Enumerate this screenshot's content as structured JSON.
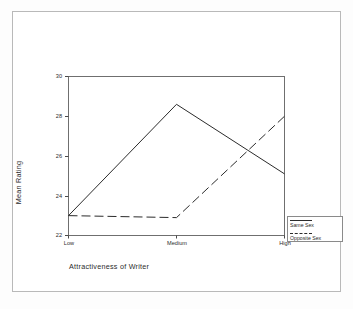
{
  "chart_data": {
    "type": "line",
    "title": "",
    "xlabel": "Attractiveness of Writer",
    "ylabel": "Mean Rating",
    "categories": [
      "Low",
      "Medium",
      "High"
    ],
    "xticklabels": [
      "Low",
      "Medium",
      "High"
    ],
    "yticklabels": [
      "22",
      "24",
      "26",
      "28",
      "30"
    ],
    "yticks": [
      22,
      24,
      26,
      28,
      30
    ],
    "ylim": [
      22,
      30
    ],
    "grid": false,
    "legend_position": "right-bottom-outside",
    "series": [
      {
        "name": "Same Sex",
        "style": "solid",
        "color": "#2b2b2b",
        "values": [
          23.0,
          28.6,
          25.1
        ]
      },
      {
        "name": "Opposite Sex",
        "style": "dashed",
        "color": "#2b2b2b",
        "values": [
          23.0,
          22.9,
          28.0
        ]
      }
    ]
  },
  "axes": {
    "x_title": "Attractiveness of Writer",
    "y_title": "Mean Rating",
    "y_tick_labels": [
      "30",
      "28",
      "26",
      "24",
      "22"
    ],
    "x_tick_labels": [
      "Low",
      "Medium",
      "High"
    ]
  },
  "legend": {
    "entries": [
      {
        "label": "Same Sex",
        "style": "solid"
      },
      {
        "label": "Opposite Sex",
        "style": "dashed"
      }
    ]
  }
}
